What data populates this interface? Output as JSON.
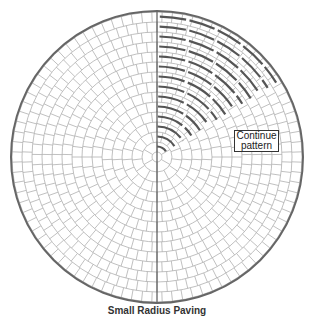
{
  "diagram": {
    "center": [
      157,
      157
    ],
    "outer_radius": 146,
    "inner_radius": 5,
    "ring_spacing": 10,
    "brick_length": 10,
    "grid_color": "#b0b0b0",
    "outline_color": "#666666",
    "axis_color": "#555555",
    "dash_color": "#555555",
    "dash_max_angle_deg": 58
  },
  "label": {
    "line1": "Continue",
    "line2": "pattern"
  },
  "caption": "Small Radius Paving"
}
